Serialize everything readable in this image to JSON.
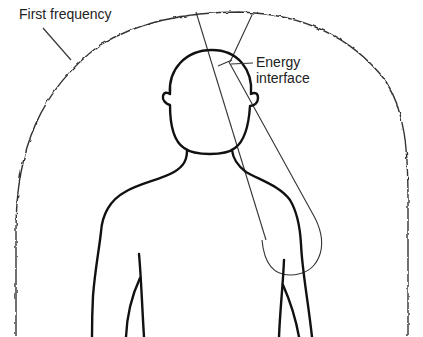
{
  "diagram": {
    "type": "illustration",
    "labels": {
      "first_frequency": "First frequency",
      "energy_interface_line1": "Energy",
      "energy_interface_line2": "interface"
    },
    "elements": [
      {
        "id": "field-boundary",
        "kind": "wavy arch",
        "label": "First frequency"
      },
      {
        "id": "human-figure",
        "kind": "outline of head, neck and shoulders"
      },
      {
        "id": "energy-cone",
        "kind": "narrow cone / lobe from top of field down over right chest"
      },
      {
        "id": "energy-interface-point",
        "kind": "intersection at top-right of head",
        "label": "Energy interface"
      }
    ],
    "colors": {
      "stroke": "#111111",
      "thin_stroke": "#333333",
      "background": "#ffffff",
      "text": "#222222"
    }
  }
}
